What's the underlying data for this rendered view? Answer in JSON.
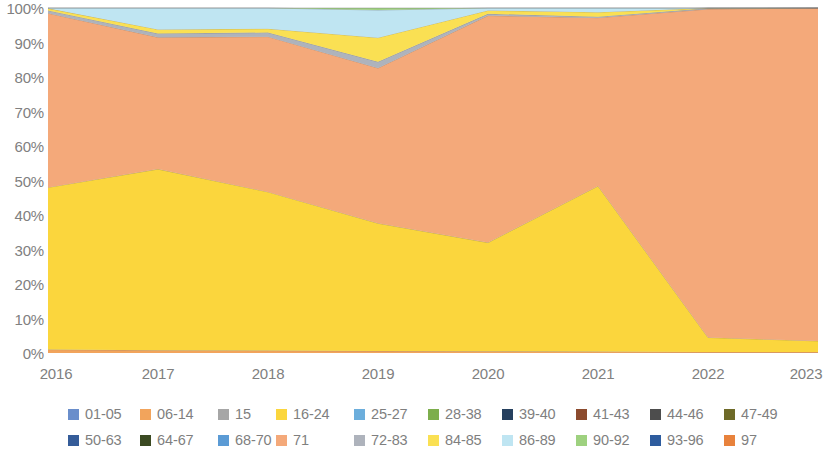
{
  "chart_data": {
    "type": "area",
    "title": "",
    "subtitle": "",
    "xlabel": "",
    "ylabel": "",
    "stacked": true,
    "normalized": true,
    "grid": false,
    "legend_position": "bottom",
    "ylim": [
      0,
      100
    ],
    "ytick_labels": [
      "100%",
      "90%",
      "80%",
      "70%",
      "60%",
      "50%",
      "40%",
      "30%",
      "20%",
      "10%",
      "0%"
    ],
    "ytick_values": [
      100,
      90,
      80,
      70,
      60,
      50,
      40,
      30,
      20,
      10,
      0
    ],
    "categories": [
      "2016",
      "2017",
      "2018",
      "2019",
      "2020",
      "2021",
      "2022",
      "2023"
    ],
    "x": [
      2016,
      2017,
      2018,
      2019,
      2020,
      2021,
      2022,
      2023
    ],
    "series": [
      {
        "name": "01-05",
        "color": "#6A8ECB",
        "values": [
          0,
          0,
          0,
          0,
          0,
          0,
          0,
          0
        ]
      },
      {
        "name": "06-14",
        "color": "#F2A45C",
        "values": [
          1.0,
          0.8,
          0.7,
          0.6,
          0.5,
          0.4,
          0.3,
          0.3
        ]
      },
      {
        "name": "15",
        "color": "#A6A6A6",
        "values": [
          0,
          0,
          0,
          0,
          0,
          0,
          0,
          0
        ]
      },
      {
        "name": "16-24",
        "color": "#FBD63D",
        "values": [
          47.0,
          52.5,
          46.0,
          37.0,
          31.5,
          48.0,
          4.2,
          3.2
        ]
      },
      {
        "name": "25-27",
        "color": "#6CAEDC",
        "values": [
          0,
          0,
          0,
          0,
          0,
          0,
          0,
          0
        ]
      },
      {
        "name": "28-38",
        "color": "#7DAE4C",
        "values": [
          0,
          0,
          0,
          0,
          0,
          0,
          0,
          0
        ]
      },
      {
        "name": "39-40",
        "color": "#26405F",
        "values": [
          0,
          0,
          0,
          0,
          0,
          0,
          0,
          0
        ]
      },
      {
        "name": "41-43",
        "color": "#8C4B2E",
        "values": [
          0,
          0,
          0,
          0,
          0,
          0,
          0,
          0
        ]
      },
      {
        "name": "44-46",
        "color": "#4D4D4D",
        "values": [
          0,
          0,
          0,
          0,
          0,
          0,
          0,
          0
        ]
      },
      {
        "name": "47-49",
        "color": "#6E6A28",
        "values": [
          0,
          0,
          0,
          0,
          0,
          0,
          0,
          0
        ]
      },
      {
        "name": "50-63",
        "color": "#355C99",
        "values": [
          0,
          0,
          0,
          0,
          0,
          0,
          0,
          0
        ]
      },
      {
        "name": "64-67",
        "color": "#3B4A22",
        "values": [
          0,
          0,
          0,
          0,
          0,
          0,
          0,
          0
        ]
      },
      {
        "name": "68-70",
        "color": "#5B9BD5",
        "values": [
          0,
          0,
          0,
          0,
          0,
          0,
          0,
          0
        ]
      },
      {
        "name": "71",
        "color": "#F4A97A",
        "values": [
          50.5,
          38.2,
          45.0,
          45.0,
          65.8,
          48.8,
          95.2,
          96.5
        ]
      },
      {
        "name": "72-83",
        "color": "#AEB3BC",
        "values": [
          0.8,
          1.1,
          1.2,
          1.8,
          0.5,
          0.3,
          0.2,
          0.0
        ]
      },
      {
        "name": "84-85",
        "color": "#FAE053",
        "values": [
          0.6,
          1.2,
          1.1,
          7.0,
          1.0,
          1.3,
          0.1,
          0.0
        ]
      },
      {
        "name": "86-89",
        "color": "#BFE5F2",
        "values": [
          0.1,
          6.2,
          6.0,
          8.0,
          0.7,
          1.2,
          0.0,
          0.0
        ]
      },
      {
        "name": "90-92",
        "color": "#9ED17F",
        "values": [
          0.0,
          0.0,
          0.0,
          0.6,
          0.0,
          0.0,
          0.0,
          0.0
        ]
      },
      {
        "name": "93-96",
        "color": "#2E5C9E",
        "values": [
          0,
          0,
          0,
          0,
          0,
          0,
          0,
          0
        ]
      },
      {
        "name": "97",
        "color": "#E8823C",
        "values": [
          0,
          0,
          0,
          0,
          0,
          0,
          0,
          0
        ]
      }
    ]
  },
  "legend": {
    "rows": [
      [
        {
          "label": "01-05",
          "color": "#6A8ECB"
        },
        {
          "label": "06-14",
          "color": "#F2A45C"
        },
        {
          "label": "15",
          "color": "#A6A6A6"
        },
        {
          "label": "16-24",
          "color": "#FBD63D"
        },
        {
          "label": "25-27",
          "color": "#6CAEDC"
        },
        {
          "label": "28-38",
          "color": "#7DAE4C"
        },
        {
          "label": "39-40",
          "color": "#26405F"
        },
        {
          "label": "41-43",
          "color": "#8C4B2E"
        },
        {
          "label": "44-46",
          "color": "#4D4D4D"
        },
        {
          "label": "47-49",
          "color": "#6E6A28"
        }
      ],
      [
        {
          "label": "50-63",
          "color": "#355C99"
        },
        {
          "label": "64-67",
          "color": "#3B4A22"
        },
        {
          "label": "68-70",
          "color": "#5B9BD5"
        },
        {
          "label": "71",
          "color": "#F4A97A"
        },
        {
          "label": "72-83",
          "color": "#AEB3BC"
        },
        {
          "label": "84-85",
          "color": "#FAE053"
        },
        {
          "label": "86-89",
          "color": "#BFE5F2"
        },
        {
          "label": "90-92",
          "color": "#9ED17F"
        },
        {
          "label": "93-96",
          "color": "#2E5C9E"
        },
        {
          "label": "97",
          "color": "#E8823C"
        }
      ]
    ]
  }
}
